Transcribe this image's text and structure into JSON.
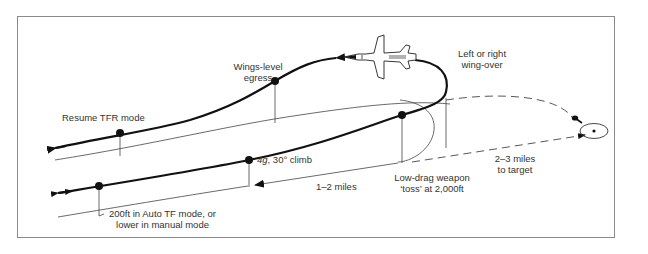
{
  "diagram": {
    "type": "flight-profile",
    "labels": {
      "wings_level_line1": "Wings-level",
      "wings_level_line2": "egress",
      "wingover_line1": "Left or right",
      "wingover_line2": "wing-over",
      "resume_tfr": "Resume TFR mode",
      "climb": "4g, 30° climb",
      "climb_g": "4g",
      "climb_rest": ", 30° climb",
      "distance_1_2": "1–2 miles",
      "toss_line1": "Low-drag weapon",
      "toss_line2": "‘toss’ at 2,000ft",
      "to_target_line1": "2–3 miles",
      "to_target_line2": "to target",
      "altitude_line1": "200ft in Auto TF mode, or",
      "altitude_line2": "lower in manual mode"
    },
    "colors": {
      "stroke": "#111111",
      "thin": "#444444",
      "frame": "#8a8a8a",
      "text": "#333333"
    },
    "icons": [
      "aircraft-icon",
      "target-icon",
      "bomb-icon"
    ]
  }
}
